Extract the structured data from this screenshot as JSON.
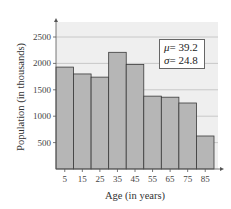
{
  "chart_data": {
    "type": "bar",
    "title": "",
    "xlabel": "Age (in years)",
    "ylabel": "Population (in thousands)",
    "categories": [
      "5",
      "15",
      "25",
      "35",
      "45",
      "55",
      "65",
      "75",
      "85"
    ],
    "values": [
      1930,
      1800,
      1740,
      2210,
      1980,
      1380,
      1360,
      1250,
      625
    ],
    "ylim": [
      0,
      2800
    ],
    "yticks": [
      500,
      1000,
      1500,
      2000,
      2500
    ],
    "grid": true,
    "annotations": [
      {
        "symbol": "μ",
        "text": "= 39.2"
      },
      {
        "symbol": "σ",
        "text": "= 24.8"
      }
    ],
    "colors": {
      "bar": "#b6b6b6",
      "bar_edge": "#3a3a3a",
      "plot_bg": "#efefef",
      "grid": "#c8c8c8"
    }
  },
  "stats": {
    "mu_symbol": "μ",
    "mu_text": "= 39.2",
    "sigma_symbol": "σ",
    "sigma_text": "= 24.8"
  }
}
